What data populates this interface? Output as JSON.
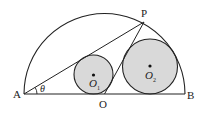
{
  "diagram": {
    "type": "geometry",
    "colors": {
      "stroke": "#222222",
      "circle_fill": "#d9d9d9",
      "background": "#ffffff"
    },
    "labels": {
      "A": "A",
      "B": "B",
      "O": "O",
      "P": "P",
      "theta": "θ",
      "O1": "O",
      "O1_sub": "1",
      "O2": "O",
      "O2_sub": "2"
    },
    "points": {
      "A": [
        24,
        94
      ],
      "B": [
        185,
        94
      ],
      "O": [
        104.5,
        94
      ],
      "P": [
        144,
        22
      ],
      "O1": [
        93.5,
        74.5
      ],
      "O2": [
        150,
        66.5
      ]
    },
    "semicircle": {
      "center": [
        104.5,
        94
      ],
      "radius": 80.5
    },
    "circle_O1": {
      "center": [
        93.5,
        74.5
      ],
      "radius": 19.5
    },
    "circle_O2": {
      "center": [
        150,
        66.5
      ],
      "radius": 27.5
    },
    "angle_at_A": "θ"
  }
}
